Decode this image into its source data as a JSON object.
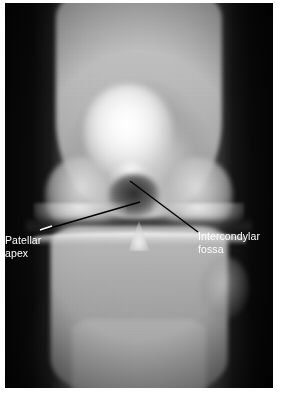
{
  "figure": {
    "type": "radiograph",
    "view": "anteroposterior-knee",
    "modality": "x-ray",
    "border_color": "#ffffff",
    "film_color": "#050505"
  },
  "annotations": {
    "label_color": "#ffffff",
    "leader_color": "#000000",
    "items": [
      {
        "id": "patellar-apex",
        "text": "Patellar\napex",
        "text_x": 5,
        "text_y": 234,
        "leader": {
          "x1": 40,
          "y1": 231,
          "x2": 140,
          "y2": 202
        },
        "tick": {
          "x1": 40,
          "y1": 230,
          "x2": 52,
          "y2": 226,
          "color": "#ffffff"
        }
      },
      {
        "id": "intercondylar-fossa",
        "text": "Intercondylar\nfossa",
        "text_x": 198,
        "text_y": 230,
        "leader": {
          "x1": 130,
          "y1": 181,
          "x2": 198,
          "y2": 232
        }
      }
    ]
  },
  "anatomy": {
    "structures": [
      "femoral shaft",
      "medial femoral condyle",
      "lateral femoral condyle",
      "intercondylar fossa",
      "patella",
      "patellar apex",
      "knee joint space",
      "tibial plateau",
      "tibial intercondylar eminence",
      "fibular head",
      "tibial shaft"
    ]
  }
}
